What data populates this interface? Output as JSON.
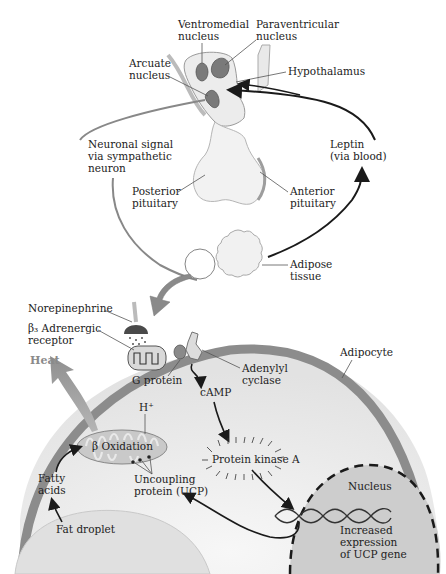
{
  "diagram": {
    "labels": {
      "ventromedial": [
        "Ventromedial",
        "nucleus"
      ],
      "paraventricular": [
        "Paraventricular",
        "nucleus"
      ],
      "arcuate": [
        "Arcuate",
        "nucleus"
      ],
      "hypothalamus": "Hypothalamus",
      "neuronal_signal": [
        "Neuronal signal",
        "via sympathetic",
        "neuron"
      ],
      "leptin": [
        "Leptin",
        "(via blood)"
      ],
      "posterior_pituitary": [
        "Posterior",
        "pituitary"
      ],
      "anterior_pituitary": [
        "Anterior",
        "pituitary"
      ],
      "adipose_tissue": [
        "Adipose",
        "tissue"
      ],
      "norepinephrine": "Norepinephrine",
      "beta3_receptor": [
        "β₃ Adrenergic",
        "receptor"
      ],
      "heat": "Heat",
      "g_protein": "G protein",
      "adenylyl_cyclase": [
        "Adenylyl",
        "cyclase"
      ],
      "adipocyte": "Adipocyte",
      "camp": "cAMP",
      "h_plus": "H⁺",
      "beta_oxidation": "β Oxidation",
      "protein_kinase_a": "Protein kinase A",
      "fatty_acids": [
        "Fatty",
        "acids"
      ],
      "ucp": [
        "Uncoupling",
        "protein (UCP)"
      ],
      "nucleus": "Nucleus",
      "fat_droplet": "Fat droplet",
      "increased_expression": [
        "Increased",
        "expression",
        "of UCP gene"
      ]
    },
    "colors": {
      "membrane": "#8c8c8c",
      "cytoplasm": "#ebebeb",
      "nucleus_fill": "#cfcfcf",
      "brain_fill": "#efefef",
      "nuclei_fill": "#7a7a7a",
      "arrow": "#1a1a1a",
      "gray_arrow": "#8a8a8a"
    }
  }
}
